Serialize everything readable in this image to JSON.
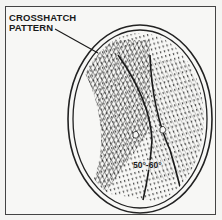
{
  "diagram": {
    "callout": {
      "line1": "CROSSHATCH",
      "line2": "PATTERN"
    },
    "angle_label": "50°-60°",
    "colors": {
      "ink": "#1a1a1a",
      "paper": "#f7f7f5",
      "frame": "#444444"
    }
  }
}
